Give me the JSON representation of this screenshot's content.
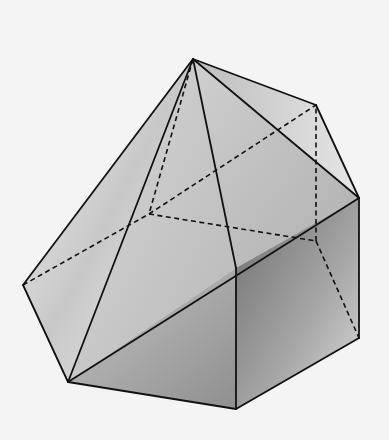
{
  "diagram": {
    "type": "polyhedron",
    "background": "#f4f4f4",
    "edge_color": "#111111",
    "vertices": {
      "A": [
        193,
        59
      ],
      "B": [
        316,
        105
      ],
      "C": [
        359,
        198
      ],
      "D": [
        359,
        338
      ],
      "E": [
        236,
        409
      ],
      "F": [
        68,
        382
      ],
      "G": [
        23,
        285
      ],
      "H": [
        236,
        268
      ],
      "I": [
        149,
        214
      ],
      "J": [
        316,
        241
      ]
    },
    "solid_edges": [
      [
        "A",
        "G"
      ],
      [
        "A",
        "F"
      ],
      [
        "A",
        "H"
      ],
      [
        "A",
        "C"
      ],
      [
        "A",
        "B"
      ],
      [
        "B",
        "C"
      ],
      [
        "C",
        "D"
      ],
      [
        "D",
        "E"
      ],
      [
        "E",
        "F"
      ],
      [
        "F",
        "G"
      ],
      [
        "H",
        "E"
      ],
      [
        "F",
        "C"
      ]
    ],
    "hidden_edges": [
      [
        "G",
        "I"
      ],
      [
        "A",
        "I"
      ],
      [
        "I",
        "B"
      ],
      [
        "I",
        "J"
      ],
      [
        "J",
        "B"
      ],
      [
        "J",
        "D"
      ]
    ],
    "faces": [
      {
        "name": "left-face",
        "points": [
          "A",
          "G",
          "F"
        ],
        "fill": "url(#gLeft)"
      },
      {
        "name": "front-upper-face",
        "points": [
          "A",
          "F",
          "H"
        ],
        "fill": "url(#gFront)"
      },
      {
        "name": "right-upper-face",
        "points": [
          "A",
          "H",
          "C"
        ],
        "fill": "url(#gRightUp)"
      },
      {
        "name": "top-right-face",
        "points": [
          "A",
          "C",
          "B"
        ],
        "fill": "url(#gTopRight)"
      },
      {
        "name": "front-lower-face",
        "points": [
          "F",
          "H",
          "E"
        ],
        "fill": "url(#gLower)"
      },
      {
        "name": "right-lower-face",
        "points": [
          "H",
          "C",
          "D",
          "E"
        ],
        "fill": "url(#gRightLow)"
      }
    ]
  }
}
